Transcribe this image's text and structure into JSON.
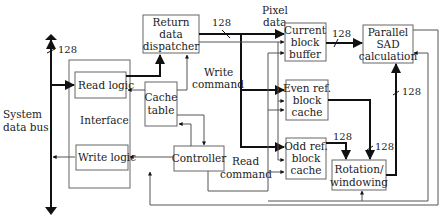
{
  "diagram": {
    "system_bus": {
      "label_line1": "System",
      "label_line2": "data bus",
      "width": "128"
    },
    "blocks": {
      "interface": {
        "label": "Interface"
      },
      "read_logic": {
        "label": "Read logic"
      },
      "write_logic": {
        "label": "Write logic"
      },
      "return_dispatcher": {
        "line1": "Return",
        "line2": "data",
        "line3": "dispatcher"
      },
      "cache_table": {
        "line1": "Cache",
        "line2": "table"
      },
      "controller": {
        "label": "Controller"
      },
      "current_block_buffer": {
        "line1": "Current",
        "line2": "block",
        "line3": "buffer"
      },
      "even_ref_cache": {
        "line1": "Even ref.",
        "line2": "block",
        "line3": "cache"
      },
      "odd_ref_cache": {
        "line1": "Odd ref.",
        "line2": "block",
        "line3": "cache"
      },
      "parallel_sad": {
        "line1": "Parallel",
        "line2": "SAD",
        "line3": "calculation"
      },
      "rotation_windowing": {
        "line1": "Rotation/",
        "line2": "windowing"
      }
    },
    "labels": {
      "pixel_data_1": "Pixel",
      "pixel_data_2": "data",
      "write_command_1": "Write",
      "write_command_2": "command",
      "read_command_1": "Read",
      "read_command_2": "command"
    },
    "bus_widths": {
      "dispatcher_out": "128",
      "current_to_sad": "128",
      "rotation_to_sad": "128",
      "odd_to_rotation": "128",
      "even_to_rotation": "128"
    }
  }
}
